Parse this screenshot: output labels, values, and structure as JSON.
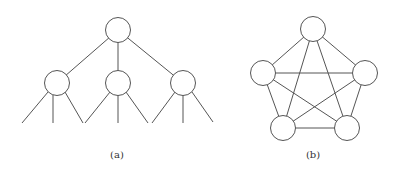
{
  "figures": [
    {
      "id": "a",
      "label": "(a)",
      "type": "tree",
      "label_pos": [
        117,
        158
      ],
      "radius": 12.5,
      "nodes": [
        {
          "name": "root",
          "x": 118,
          "y": 30
        },
        {
          "name": "child-left",
          "x": 57,
          "y": 83
        },
        {
          "name": "child-middle",
          "x": 118,
          "y": 83
        },
        {
          "name": "child-right",
          "x": 183,
          "y": 83
        }
      ],
      "edges": [
        [
          0,
          1
        ],
        [
          0,
          2
        ],
        [
          0,
          3
        ]
      ],
      "leaf_lines": [
        [
          48,
          92,
          22,
          123
        ],
        [
          53,
          95,
          53,
          123
        ],
        [
          65,
          92,
          83,
          123
        ],
        [
          110,
          92,
          85,
          123
        ],
        [
          118,
          95,
          118,
          123
        ],
        [
          126,
          92,
          148,
          123
        ],
        [
          175,
          92,
          152,
          123
        ],
        [
          183,
          95,
          183,
          123
        ],
        [
          192,
          92,
          213,
          122
        ]
      ]
    },
    {
      "id": "b",
      "label": "(b)",
      "type": "complete-graph-k5",
      "label_pos": [
        313,
        158
      ],
      "radius": 12.5,
      "nodes": [
        {
          "name": "top",
          "x": 313,
          "y": 29
        },
        {
          "name": "left",
          "x": 263,
          "y": 73
        },
        {
          "name": "right",
          "x": 365,
          "y": 73
        },
        {
          "name": "bottom-left",
          "x": 283,
          "y": 128
        },
        {
          "name": "bottom-right",
          "x": 347,
          "y": 128
        }
      ],
      "edges": [
        [
          0,
          1
        ],
        [
          0,
          2
        ],
        [
          0,
          3
        ],
        [
          0,
          4
        ],
        [
          1,
          2
        ],
        [
          1,
          3
        ],
        [
          1,
          4
        ],
        [
          2,
          3
        ],
        [
          2,
          4
        ],
        [
          3,
          4
        ]
      ]
    }
  ]
}
